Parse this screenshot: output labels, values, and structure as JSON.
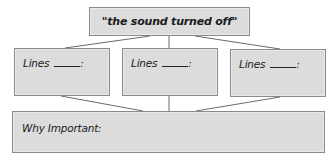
{
  "diagram": {
    "top_box": {
      "text": "\"the sound turned off\""
    },
    "middle_boxes": [
      {
        "label": "Lines",
        "blank": "",
        "suffix": ":"
      },
      {
        "label": "Lines",
        "blank": "",
        "suffix": ":"
      },
      {
        "label": "Lines",
        "blank": "",
        "suffix": ":"
      }
    ],
    "bottom_box": {
      "label": "Why Important:"
    },
    "colors": {
      "box_fill": "#dcdcdc",
      "box_border": "#8a8a8a",
      "connector": "#6a6a6a"
    }
  }
}
